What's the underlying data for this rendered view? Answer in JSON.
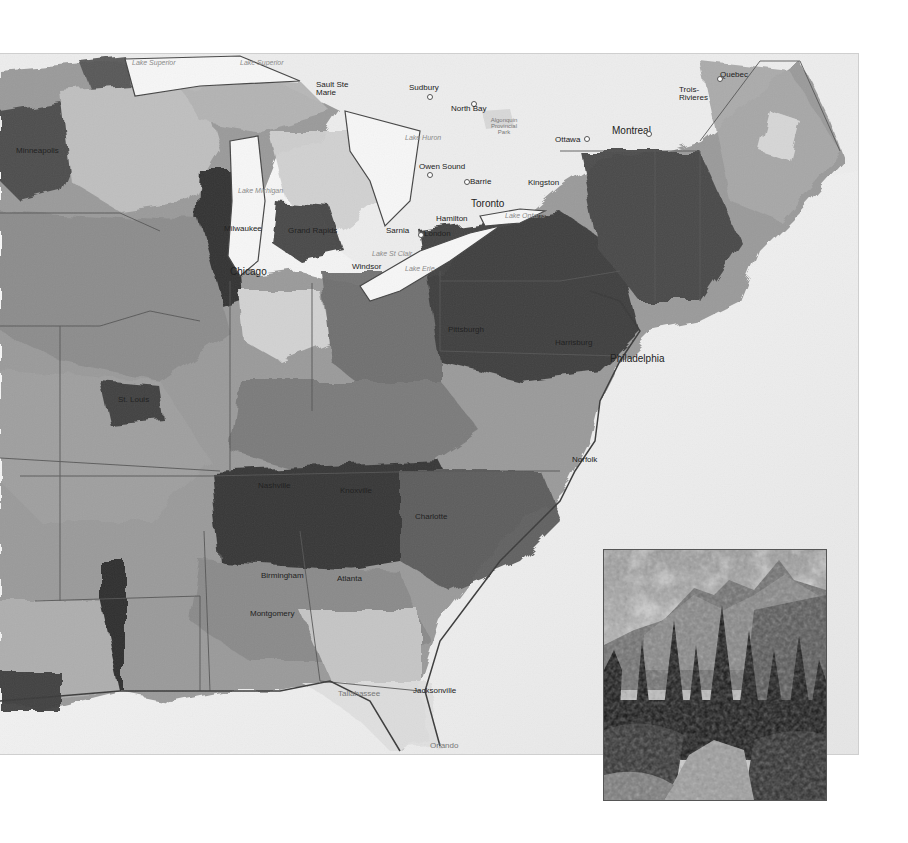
{
  "map": {
    "title": "",
    "style": "grayscale choropleth",
    "region": "Eastern United States & Southeastern Canada",
    "water_labels": [
      "Lake Superior",
      "Lake Superior",
      "Lake Michigan",
      "Lake Huron",
      "Lake Erie",
      "Lake Ontario",
      "Lake St Clair"
    ],
    "cities": [
      {
        "name": "Sudbury",
        "x": 409,
        "y": 85
      },
      {
        "name": "North Bay",
        "x": 451,
        "y": 104
      },
      {
        "name": "Algonquin Provincial Park",
        "x": 494,
        "y": 118
      },
      {
        "name": "Ottawa",
        "x": 554,
        "y": 137
      },
      {
        "name": "Montreal",
        "x": 612,
        "y": 127
      },
      {
        "name": "Trois-Rivieres",
        "x": 679,
        "y": 88
      },
      {
        "name": "Quebec",
        "x": 720,
        "y": 73
      },
      {
        "name": "Owen Sound",
        "x": 420,
        "y": 164
      },
      {
        "name": "Barrie",
        "x": 468,
        "y": 180
      },
      {
        "name": "Kingston",
        "x": 528,
        "y": 180
      },
      {
        "name": "Toronto",
        "x": 471,
        "y": 201
      },
      {
        "name": "Hamilton",
        "x": 436,
        "y": 215
      },
      {
        "name": "London",
        "x": 422,
        "y": 232
      },
      {
        "name": "Sarnia",
        "x": 386,
        "y": 229
      },
      {
        "name": "Windsor",
        "x": 350,
        "y": 264
      },
      {
        "name": "Sault Ste Marie",
        "x": 333,
        "y": 95
      },
      {
        "name": "Milwaukee",
        "x": 224,
        "y": 227
      },
      {
        "name": "Chicago",
        "x": 230,
        "y": 270
      },
      {
        "name": "Grand Rapids",
        "x": 288,
        "y": 228
      },
      {
        "name": "Minneapolis",
        "x": 16,
        "y": 148
      },
      {
        "name": "Pittsburgh",
        "x": 448,
        "y": 327
      },
      {
        "name": "Harrisburg",
        "x": 555,
        "y": 340
      },
      {
        "name": "Philadelphia",
        "x": 627,
        "y": 358
      },
      {
        "name": "Norfolk",
        "x": 572,
        "y": 458
      },
      {
        "name": "St. Louis",
        "x": 118,
        "y": 398
      },
      {
        "name": "Nashville",
        "x": 258,
        "y": 484
      },
      {
        "name": "Knoxville",
        "x": 340,
        "y": 489
      },
      {
        "name": "Charlotte",
        "x": 415,
        "y": 515
      },
      {
        "name": "Atlanta",
        "x": 337,
        "y": 577
      },
      {
        "name": "Birmingham",
        "x": 261,
        "y": 574
      },
      {
        "name": "Montgomery",
        "x": 250,
        "y": 612
      },
      {
        "name": "Jacksonville",
        "x": 413,
        "y": 689
      },
      {
        "name": "Tallahassee",
        "x": 338,
        "y": 692
      },
      {
        "name": "Orlando",
        "x": 430,
        "y": 745
      }
    ]
  },
  "inset_photo": {
    "subject": "mountain peaks above a conifer forest and rocky stream",
    "tone": "black and white"
  }
}
